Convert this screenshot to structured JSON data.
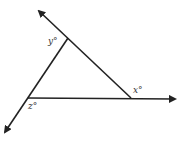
{
  "diagram": {
    "type": "triangle-with-extended-sides",
    "stroke_color": "#222222",
    "labels": {
      "top_angle": "y°",
      "bottom_left_angle": "z°",
      "right_angle": "x°"
    }
  }
}
